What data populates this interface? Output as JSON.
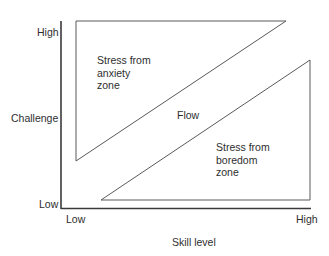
{
  "diagram": {
    "title": "",
    "y_axis": {
      "label": "Challenge",
      "high_label": "High",
      "low_label": "Low"
    },
    "x_axis": {
      "label": "Skill level",
      "low_label": "Low",
      "high_label": "High"
    },
    "zones": {
      "anxiety": {
        "line1": "Stress from",
        "line2": "anxiety",
        "line3": "zone"
      },
      "flow": {
        "label": "Flow"
      },
      "boredom": {
        "line1": "Stress from",
        "line2": "boredom",
        "line3": "zone"
      }
    },
    "colors": {
      "axis": "#3a3a3a",
      "triangle_stroke": "#5a5a5a",
      "text": "#2e2e2e",
      "background": "#ffffff"
    }
  }
}
